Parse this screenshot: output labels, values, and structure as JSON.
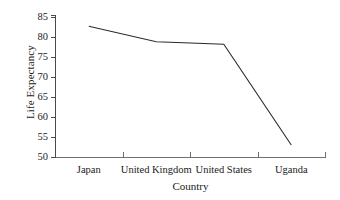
{
  "chart_data": {
    "type": "line",
    "title": "",
    "xlabel": "Country",
    "ylabel": "Life Expectancy",
    "categories": [
      "Japan",
      "United Kingdom",
      "United States",
      "Uganda"
    ],
    "values": [
      82.7,
      78.8,
      78.2,
      53.0
    ],
    "series": [
      {
        "name": "Life Expectancy",
        "values": [
          82.7,
          78.8,
          78.2,
          53.0
        ]
      }
    ],
    "ylim": [
      50,
      85
    ],
    "yticks": [
      50,
      55,
      60,
      65,
      70,
      75,
      80,
      85
    ],
    "ytick_labels": [
      "50",
      "55",
      "60",
      "65",
      "70",
      "75",
      "80",
      "85"
    ],
    "grid": false,
    "legend": false,
    "legend_position": "none",
    "markers": false,
    "line_color": "#2b2b2b",
    "axis_color": "#5a5a5a",
    "background_color": "#ffffff"
  },
  "axes": {
    "y_title": "Life Expectancy",
    "x_title": "Country"
  }
}
